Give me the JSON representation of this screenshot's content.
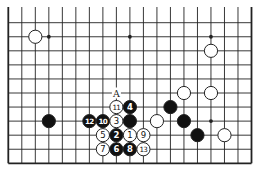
{
  "diagram": {
    "type": "go-board-fragment",
    "colors": {
      "line": "#222222",
      "black_stone": "#111111",
      "white_stone": "#ffffff",
      "background": "#ffffff"
    },
    "grid": {
      "columns": 19,
      "rows_visible": 11,
      "left_edge": true,
      "right_edge": true,
      "bottom_edge": true,
      "top_edge": false
    },
    "star_points": [
      {
        "col": 3,
        "row": 1
      },
      {
        "col": 9,
        "row": 1
      },
      {
        "col": 15,
        "row": 1
      },
      {
        "col": 15,
        "row": 7
      }
    ],
    "stones": [
      {
        "color": "white",
        "col": 2,
        "row": 1,
        "label": ""
      },
      {
        "color": "white",
        "col": 15,
        "row": 2,
        "label": ""
      },
      {
        "color": "white",
        "col": 13,
        "row": 5,
        "label": ""
      },
      {
        "color": "white",
        "col": 15,
        "row": 5,
        "label": ""
      },
      {
        "color": "black",
        "col": 12,
        "row": 6,
        "label": ""
      },
      {
        "color": "black",
        "col": 3,
        "row": 7,
        "label": ""
      },
      {
        "color": "black",
        "col": 6,
        "row": 7,
        "label": "12"
      },
      {
        "color": "black",
        "col": 7,
        "row": 7,
        "label": "10"
      },
      {
        "color": "white",
        "col": 8,
        "row": 7,
        "label": "3"
      },
      {
        "color": "black",
        "col": 9,
        "row": 7,
        "label": ""
      },
      {
        "color": "white",
        "col": 8,
        "row": 6,
        "label": "11"
      },
      {
        "color": "black",
        "col": 9,
        "row": 6,
        "label": "4"
      },
      {
        "color": "white",
        "col": 11,
        "row": 7,
        "label": ""
      },
      {
        "color": "black",
        "col": 13,
        "row": 7,
        "label": ""
      },
      {
        "color": "white",
        "col": 7,
        "row": 8,
        "label": "5"
      },
      {
        "color": "black",
        "col": 8,
        "row": 8,
        "label": "2"
      },
      {
        "color": "white",
        "col": 9,
        "row": 8,
        "label": "1"
      },
      {
        "color": "white",
        "col": 10,
        "row": 8,
        "label": "9"
      },
      {
        "color": "black",
        "col": 14,
        "row": 8,
        "label": ""
      },
      {
        "color": "white",
        "col": 16,
        "row": 8,
        "label": ""
      },
      {
        "color": "white",
        "col": 7,
        "row": 9,
        "label": "7"
      },
      {
        "color": "black",
        "col": 8,
        "row": 9,
        "label": "6"
      },
      {
        "color": "black",
        "col": 9,
        "row": 9,
        "label": "8"
      },
      {
        "color": "white",
        "col": 10,
        "row": 9,
        "label": "13"
      }
    ],
    "markers": [
      {
        "text": "A",
        "col": 8,
        "row": 5
      }
    ]
  }
}
